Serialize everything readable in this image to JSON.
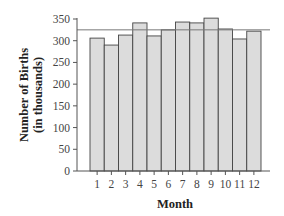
{
  "chart_data": {
    "type": "bar",
    "title": "",
    "xlabel": "Month",
    "ylabel": "Number of Births",
    "ylabel_sub": "(in thousands)",
    "categories": [
      "1",
      "2",
      "3",
      "4",
      "5",
      "6",
      "7",
      "8",
      "9",
      "10",
      "11",
      "12"
    ],
    "values": [
      306,
      290,
      313,
      341,
      311,
      325,
      343,
      341,
      352,
      327,
      304,
      322
    ],
    "reference_line": 325,
    "ylim": [
      0,
      350
    ],
    "yticks": [
      0,
      50,
      100,
      150,
      200,
      250,
      300,
      350
    ],
    "grid": false,
    "legend": null
  },
  "colors": {
    "bar_fill": "#dcdcdc",
    "bar_stroke": "#444444",
    "axis": "#555555",
    "reference_line": "#777777",
    "text": "#333333"
  }
}
